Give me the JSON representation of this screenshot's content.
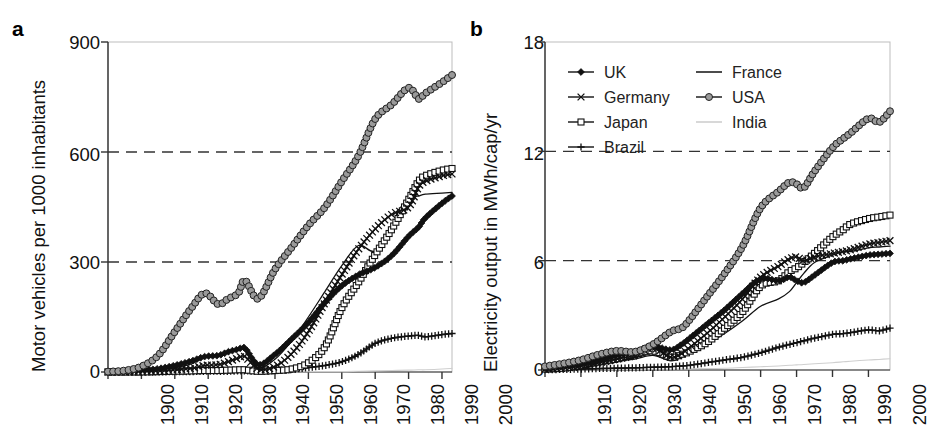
{
  "figure": {
    "panels": [
      {
        "letter": "a",
        "ylabel": "Motor vehicles per 1000 inhabitants",
        "yticks": [
          "0",
          "300",
          "600",
          "900"
        ],
        "xticks": [
          "1900",
          "1910",
          "1920",
          "1930",
          "1940",
          "1950",
          "1960",
          "1970",
          "1980",
          "1990",
          "2000"
        ]
      },
      {
        "letter": "b",
        "ylabel": "Electricity output in MWh/cap/yr",
        "yticks": [
          "0",
          "6",
          "12",
          "18"
        ],
        "xticks": [
          "1910",
          "1920",
          "1930",
          "1940",
          "1950",
          "1960",
          "1970",
          "1980",
          "1990",
          "2000"
        ]
      }
    ],
    "legend": {
      "entries": [
        {
          "label": "UK",
          "marker": "filled-diamond",
          "color": "#111111",
          "column": 0
        },
        {
          "label": "Germany",
          "marker": "cross-x",
          "color": "#111111",
          "column": 0
        },
        {
          "label": "Japan",
          "marker": "open-square",
          "color": "#111111",
          "column": 0
        },
        {
          "label": "Brazil",
          "marker": "plus",
          "color": "#111111",
          "column": 0
        },
        {
          "label": "France",
          "marker": "line",
          "color": "#111111",
          "column": 1
        },
        {
          "label": "USA",
          "marker": "filled-circle",
          "color": "#9a9a9a",
          "column": 1
        },
        {
          "label": "India",
          "marker": "line-light",
          "color": "#c8c8c8",
          "column": 1
        }
      ]
    }
  },
  "chart_data": [
    {
      "type": "line",
      "panel": "a",
      "title": "",
      "xlabel": "",
      "ylabel": "Motor vehicles per 1000 inhabitants",
      "xlim": [
        1900,
        2003
      ],
      "ylim": [
        0,
        900
      ],
      "yticks": [
        0,
        300,
        600,
        900
      ],
      "xticks": [
        1900,
        1910,
        1920,
        1930,
        1940,
        1950,
        1960,
        1970,
        1980,
        1990,
        2000
      ],
      "grid": "dashed horizontal at 300 and 600",
      "legend_position": "none",
      "x": [
        1900,
        1905,
        1910,
        1915,
        1920,
        1925,
        1929,
        1933,
        1936,
        1939,
        1941,
        1945,
        1950,
        1955,
        1960,
        1965,
        1970,
        1975,
        1980,
        1985,
        1990,
        1993,
        1995,
        2000,
        2003
      ],
      "series": [
        {
          "name": "USA",
          "marker": "filled-circle",
          "color": "#9a9a9a",
          "values": [
            1,
            4,
            15,
            45,
            110,
            175,
            215,
            185,
            200,
            215,
            250,
            200,
            280,
            340,
            400,
            450,
            520,
            590,
            690,
            730,
            775,
            745,
            760,
            790,
            810
          ]
        },
        {
          "name": "Japan",
          "marker": "open-square",
          "color": "#111111",
          "values": [
            0,
            0,
            0,
            1,
            2,
            3,
            4,
            4,
            5,
            6,
            6,
            2,
            4,
            8,
            25,
            70,
            175,
            245,
            320,
            390,
            470,
            520,
            535,
            550,
            555
          ]
        },
        {
          "name": "Germany",
          "marker": "cross-x",
          "color": "#111111",
          "values": [
            0,
            1,
            2,
            3,
            6,
            10,
            18,
            20,
            28,
            38,
            42,
            8,
            15,
            50,
            110,
            190,
            265,
            335,
            390,
            430,
            450,
            505,
            520,
            535,
            540
          ]
        },
        {
          "name": "France",
          "marker": "line",
          "color": "#111111",
          "values": [
            0,
            1,
            3,
            6,
            12,
            22,
            40,
            45,
            55,
            60,
            62,
            12,
            35,
            85,
            150,
            220,
            290,
            345,
            330,
            400,
            470,
            480,
            485,
            488,
            490
          ]
        },
        {
          "name": "UK",
          "marker": "filled-diamond",
          "color": "#111111",
          "values": [
            0,
            2,
            5,
            9,
            18,
            30,
            42,
            45,
            55,
            62,
            65,
            20,
            48,
            90,
            135,
            190,
            235,
            265,
            285,
            318,
            370,
            395,
            420,
            460,
            480
          ]
        },
        {
          "name": "Brazil",
          "marker": "plus",
          "color": "#111111",
          "values": [
            0,
            0,
            0,
            0,
            1,
            1,
            2,
            2,
            2,
            3,
            3,
            2,
            4,
            7,
            12,
            18,
            28,
            48,
            78,
            92,
            98,
            100,
            96,
            102,
            105
          ]
        },
        {
          "name": "India",
          "marker": "line-light",
          "color": "#c8c8c8",
          "values": [
            0,
            0,
            0,
            0,
            0,
            0,
            0,
            0,
            0,
            0,
            0,
            0,
            0,
            0,
            1,
            1,
            1,
            2,
            3,
            4,
            5,
            6,
            6,
            8,
            10
          ]
        }
      ]
    },
    {
      "type": "line",
      "panel": "b",
      "title": "",
      "xlabel": "",
      "ylabel": "Electricity output in MWh/cap/yr",
      "xlim": [
        1910,
        2006
      ],
      "ylim": [
        0,
        18
      ],
      "yticks": [
        0,
        6,
        12,
        18
      ],
      "xticks": [
        1910,
        1920,
        1930,
        1940,
        1950,
        1960,
        1970,
        1980,
        1990,
        2000
      ],
      "grid": "dashed horizontal at 6 and 12",
      "legend_position": "top-left",
      "x": [
        1910,
        1915,
        1920,
        1925,
        1930,
        1935,
        1940,
        1945,
        1948,
        1950,
        1955,
        1960,
        1965,
        1970,
        1975,
        1978,
        1980,
        1982,
        1985,
        1990,
        1993,
        1995,
        2000,
        2003,
        2006
      ],
      "series": [
        {
          "name": "USA",
          "marker": "filled-circle",
          "color": "#9a9a9a",
          "values": [
            0.2,
            0.35,
            0.55,
            0.85,
            1.05,
            1.0,
            1.4,
            2.1,
            2.3,
            2.7,
            4.0,
            5.3,
            6.8,
            8.9,
            9.8,
            10.3,
            10.2,
            10.0,
            10.9,
            12.2,
            12.7,
            13.0,
            13.8,
            13.6,
            14.2
          ]
        },
        {
          "name": "Japan",
          "marker": "open-square",
          "color": "#111111",
          "values": [
            0.05,
            0.1,
            0.25,
            0.45,
            0.6,
            0.85,
            1.05,
            0.7,
            0.85,
            1.0,
            1.5,
            2.3,
            3.2,
            4.6,
            4.9,
            5.4,
            5.6,
            5.9,
            6.4,
            7.3,
            7.7,
            8.0,
            8.3,
            8.4,
            8.5
          ]
        },
        {
          "name": "Germany",
          "marker": "cross-x",
          "color": "#111111",
          "values": [
            0.05,
            0.1,
            0.2,
            0.4,
            0.6,
            0.8,
            1.2,
            0.7,
            0.9,
            1.2,
            2.0,
            2.9,
            3.9,
            5.1,
            5.7,
            6.1,
            6.2,
            6.0,
            6.2,
            6.4,
            6.5,
            6.6,
            6.9,
            7.0,
            7.1
          ]
        },
        {
          "name": "France",
          "marker": "line",
          "color": "#111111",
          "values": [
            0.05,
            0.1,
            0.2,
            0.35,
            0.5,
            0.6,
            0.8,
            0.5,
            0.7,
            0.9,
            1.4,
            2.0,
            2.7,
            3.5,
            3.9,
            4.3,
            4.8,
            5.3,
            5.9,
            6.3,
            6.5,
            6.5,
            6.7,
            6.75,
            6.8
          ]
        },
        {
          "name": "UK",
          "marker": "filled-diamond",
          "color": "#111111",
          "values": [
            0.1,
            0.2,
            0.35,
            0.55,
            0.8,
            1.0,
            1.3,
            1.1,
            1.4,
            1.7,
            2.5,
            3.3,
            4.2,
            5.0,
            4.9,
            5.1,
            4.9,
            4.8,
            5.2,
            5.9,
            6.0,
            6.1,
            6.3,
            6.35,
            6.4
          ]
        },
        {
          "name": "Brazil",
          "marker": "plus",
          "color": "#111111",
          "values": [
            0.02,
            0.03,
            0.05,
            0.08,
            0.1,
            0.12,
            0.15,
            0.18,
            0.22,
            0.25,
            0.4,
            0.55,
            0.7,
            0.95,
            1.25,
            1.4,
            1.5,
            1.6,
            1.75,
            1.95,
            2.0,
            2.05,
            2.2,
            2.15,
            2.3
          ]
        },
        {
          "name": "India",
          "marker": "line-light",
          "color": "#c8c8c8",
          "values": [
            0.0,
            0.0,
            0.01,
            0.01,
            0.02,
            0.03,
            0.04,
            0.04,
            0.05,
            0.06,
            0.08,
            0.1,
            0.14,
            0.18,
            0.22,
            0.26,
            0.28,
            0.3,
            0.34,
            0.4,
            0.45,
            0.48,
            0.55,
            0.58,
            0.62
          ]
        }
      ]
    }
  ]
}
